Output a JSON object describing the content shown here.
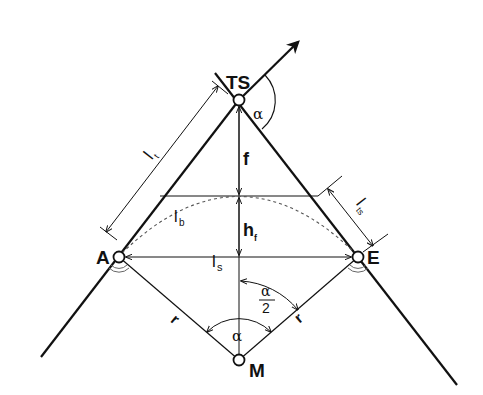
{
  "diagram": {
    "points": {
      "TS": {
        "label": "TS",
        "x": 239,
        "y": 100
      },
      "A": {
        "label": "A",
        "x": 119,
        "y": 257
      },
      "E": {
        "label": "E",
        "x": 358,
        "y": 257
      },
      "M": {
        "label": "M",
        "x": 239,
        "y": 360
      }
    },
    "labels": {
      "tangent_length": "l",
      "tangent_length_sub": "t",
      "arc_length": "l",
      "arc_length_sub": "b",
      "chord_length": "l",
      "chord_length_sub": "s",
      "tangent_segment": "l",
      "tangent_segment_sub": "ts",
      "apex_distance": "f",
      "arc_height": "h",
      "arc_height_sub": "f",
      "radius_left": "r",
      "radius_right": "r",
      "deflection_angle": "α",
      "central_angle": "α",
      "half_angle_num": "α",
      "half_angle_den": "2"
    },
    "colors": {
      "stroke": "#111111",
      "dashed": "#555555",
      "background": "#ffffff"
    }
  }
}
